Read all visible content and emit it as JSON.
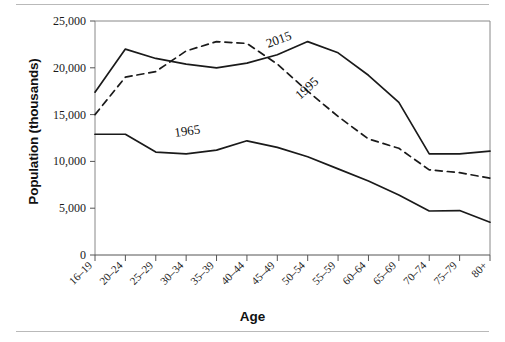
{
  "figure": {
    "top_rule": "",
    "bottom_rule": ""
  },
  "axis": {
    "ylabel": "Population (thousands)",
    "xlabel": "Age",
    "y_ticks": [
      "0",
      "5,000",
      "10,000",
      "15,000",
      "20,000",
      "25,000"
    ]
  },
  "series_labels": {
    "s2015": "2015",
    "s1995": "1995",
    "s1965": "1965"
  },
  "chart_data": {
    "type": "line",
    "title": "",
    "subtitle": "",
    "xlabel": "Age",
    "ylabel": "Population (thousands)",
    "categories": [
      "16–19",
      "20–24",
      "25–29",
      "30–34",
      "35–39",
      "40–44",
      "45–49",
      "50–54",
      "55–59",
      "60–64",
      "65–69",
      "70–74",
      "75–79",
      "80+"
    ],
    "ylim": [
      0,
      25000
    ],
    "ytick_values": [
      0,
      5000,
      10000,
      15000,
      20000,
      25000
    ],
    "grid": false,
    "legend": "inline-annotations",
    "series": [
      {
        "name": "2015",
        "style": "solid",
        "color": "#1a1a1a",
        "values": [
          17400,
          22000,
          21000,
          20400,
          20000,
          20500,
          21400,
          22800,
          21600,
          19200,
          16300,
          10800,
          10800,
          11100
        ]
      },
      {
        "name": "1995",
        "style": "dashed",
        "color": "#1a1a1a",
        "values": [
          15000,
          19000,
          19600,
          21800,
          22800,
          22600,
          20400,
          17500,
          14800,
          12400,
          11400,
          9100,
          8800,
          8200
        ]
      },
      {
        "name": "1965",
        "style": "solid",
        "color": "#1a1a1a",
        "values": [
          12900,
          12900,
          11000,
          10800,
          11200,
          12200,
          11500,
          10500,
          9200,
          7900,
          6400,
          4700,
          4750,
          3500
        ]
      }
    ],
    "annotations": [
      {
        "text": "2015",
        "near_category": "50–54",
        "rotation": -20
      },
      {
        "text": "1995",
        "near_category": "55–59",
        "rotation": -42
      },
      {
        "text": "1965",
        "near_category": "35–39",
        "rotation": -8
      }
    ]
  }
}
